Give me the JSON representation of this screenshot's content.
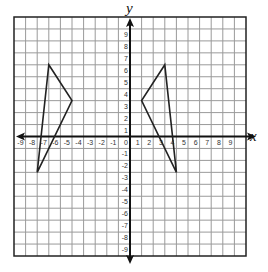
{
  "chart_data": {
    "type": "scatter",
    "subtype": "coordinate-plane-polygons",
    "title": "",
    "xlabel": "x",
    "ylabel": "y",
    "xlim": [
      -10,
      10
    ],
    "ylim": [
      -10,
      10
    ],
    "grid": true,
    "x_tick_labels": [
      "-9",
      "-8",
      "-7",
      "-6",
      "-5",
      "-4",
      "-3",
      "-2",
      "-1",
      "0",
      "1",
      "2",
      "3",
      "4",
      "5",
      "6",
      "7",
      "8",
      "9"
    ],
    "y_tick_labels": [
      "9",
      "8",
      "7",
      "6",
      "5",
      "4",
      "3",
      "2",
      "1",
      "-1",
      "-2",
      "-3",
      "-4",
      "-5",
      "-6",
      "-7",
      "-8",
      "-9"
    ],
    "series": [
      {
        "name": "left-triangle",
        "points": [
          [
            -7,
            6
          ],
          [
            -5,
            3
          ],
          [
            -8,
            -3
          ]
        ]
      },
      {
        "name": "right-triangle",
        "points": [
          [
            3,
            6
          ],
          [
            1,
            3
          ],
          [
            4,
            -3
          ]
        ]
      }
    ]
  },
  "colors": {
    "grid": "#9a9a9a",
    "border": "#222222",
    "axis": "#111111",
    "shape": "#222222"
  }
}
